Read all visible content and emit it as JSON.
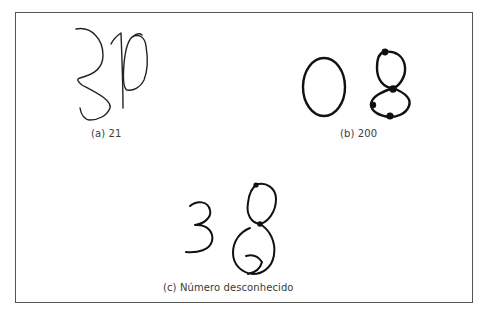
{
  "figure": {
    "panels": [
      {
        "id": "a",
        "caption": "(a) 21",
        "handwritten_glyphs": [
          "3",
          "1",
          "0"
        ]
      },
      {
        "id": "b",
        "caption": "(b) 200",
        "handwritten_glyphs": [
          "0",
          "8"
        ]
      },
      {
        "id": "c",
        "caption": "(c) Número desconhecido",
        "handwritten_glyphs": [
          "3",
          "8"
        ]
      }
    ],
    "colors": {
      "ink": "#111111",
      "border": "#555555",
      "caption": "#3a3a3a",
      "background": "#ffffff"
    }
  }
}
